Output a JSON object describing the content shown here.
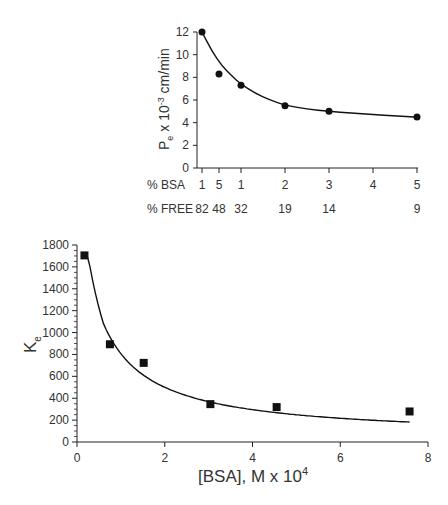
{
  "chart_data": [
    {
      "type": "scatter",
      "id": "top",
      "title": "",
      "ylabel": "P",
      "ylabel_sub": "e",
      "ylabel_rest": " x 10",
      "ylabel_sup": "-3",
      "ylabel_unit": " cm/min",
      "ylim": [
        0,
        12
      ],
      "yticks": [
        0,
        2,
        4,
        6,
        8,
        10,
        12
      ],
      "x_rows": [
        {
          "label": "% BSA",
          "ticks": [
            "1",
            "5",
            "1",
            "2",
            "3",
            "4",
            "5"
          ]
        },
        {
          "label": "% FREE",
          "ticks": [
            "82",
            "48",
            "32",
            "",
            "19",
            "14",
            "",
            "9"
          ]
        }
      ],
      "bsa_row_labels": [
        "1",
        "5",
        "1",
        "2",
        "3",
        "4",
        "5"
      ],
      "free_row_labels": [
        "82",
        "48",
        "32",
        "19",
        "14",
        "9"
      ],
      "x_positions_bsa": [
        0.1,
        0.5,
        1,
        2,
        3,
        4,
        5
      ],
      "points": [
        {
          "x": 0.1,
          "y": 12.0
        },
        {
          "x": 0.5,
          "y": 8.3
        },
        {
          "x": 1.0,
          "y": 7.3
        },
        {
          "x": 2.0,
          "y": 5.5
        },
        {
          "x": 3.0,
          "y": 5.0
        },
        {
          "x": 5.0,
          "y": 4.5
        }
      ],
      "marker": "circle",
      "fit_curve": true
    },
    {
      "type": "scatter",
      "id": "bottom",
      "title": "",
      "xlabel": "[BSA], M x 10",
      "xlabel_sup": "4",
      "ylabel": "K",
      "ylabel_sub": "e",
      "xlim": [
        0,
        8
      ],
      "ylim": [
        0,
        1800
      ],
      "xticks": [
        0,
        2,
        4,
        6,
        8
      ],
      "yticks": [
        0,
        200,
        400,
        600,
        800,
        1000,
        1200,
        1400,
        1600,
        1800
      ],
      "points": [
        {
          "x": 0.17,
          "y": 1705
        },
        {
          "x": 0.75,
          "y": 893
        },
        {
          "x": 1.52,
          "y": 723
        },
        {
          "x": 3.04,
          "y": 346
        },
        {
          "x": 4.55,
          "y": 319
        },
        {
          "x": 7.58,
          "y": 279
        }
      ],
      "marker": "square",
      "fit_curve": true
    }
  ],
  "labels": {
    "top_ylabel_P": "P",
    "top_ylabel_e": "e",
    "top_ylabel_x10": " x 10",
    "top_ylabel_exp": "-3",
    "top_ylabel_unit": " cm/min",
    "bsa_row": "% BSA",
    "free_row": "% FREE",
    "bottom_ylabel_K": "K",
    "bottom_ylabel_e": "e",
    "bottom_xlabel": "[BSA], M x 10",
    "bottom_xlabel_exp": "4"
  }
}
